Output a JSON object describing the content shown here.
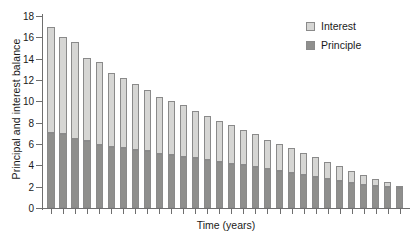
{
  "chart_data": {
    "type": "bar",
    "title": "",
    "subtitle": "",
    "xlabel": "Time (years)",
    "ylabel": "Principal and interest balance",
    "ylim": [
      0,
      18
    ],
    "ytick_values": [
      0,
      2,
      4,
      6,
      8,
      10,
      12,
      14,
      16,
      18
    ],
    "ytick_labels": [
      "0",
      "2",
      "4",
      "6",
      "8",
      "10",
      "12",
      "14",
      "16",
      "18"
    ],
    "xtick_labels": [],
    "grid": false,
    "stacked": true,
    "legend_position": "top-right",
    "categories": [
      1,
      2,
      3,
      4,
      5,
      6,
      7,
      8,
      9,
      10,
      11,
      12,
      13,
      14,
      15,
      16,
      17,
      18,
      19,
      20,
      21,
      22,
      23,
      24,
      25,
      26,
      27,
      28,
      29,
      30
    ],
    "series": [
      {
        "name": "Principle",
        "color": "#8f8f8d",
        "values": [
          7.0,
          6.95,
          6.45,
          6.3,
          5.95,
          5.7,
          5.6,
          5.45,
          5.3,
          5.1,
          4.95,
          4.8,
          4.65,
          4.5,
          4.35,
          4.15,
          4.0,
          3.85,
          3.65,
          3.5,
          3.3,
          3.1,
          2.9,
          2.7,
          2.5,
          2.35,
          2.2,
          2.05,
          1.95,
          1.9
        ]
      },
      {
        "name": "Interest",
        "color": "#d6d6d4",
        "values": [
          10.0,
          9.05,
          9.1,
          7.8,
          7.75,
          6.95,
          6.6,
          6.2,
          5.75,
          5.35,
          5.05,
          4.85,
          4.45,
          4.1,
          3.85,
          3.6,
          3.3,
          3.05,
          2.75,
          2.5,
          2.3,
          2.05,
          1.85,
          1.6,
          1.4,
          1.15,
          0.9,
          0.65,
          0.45,
          0.1
        ]
      }
    ],
    "totals": [
      17.0,
      16.0,
      15.55,
      14.1,
      13.7,
      12.65,
      12.2,
      11.65,
      11.05,
      10.45,
      10.0,
      9.65,
      9.1,
      8.6,
      8.2,
      7.75,
      7.3,
      6.9,
      6.4,
      6.0,
      5.6,
      5.15,
      4.75,
      4.3,
      3.9,
      3.5,
      3.1,
      2.7,
      2.4,
      2.0
    ]
  },
  "legend": {
    "items": [
      {
        "label": "Interest",
        "color": "#d6d6d4"
      },
      {
        "label": "Principle",
        "color": "#8f8f8d"
      }
    ]
  },
  "axes": {
    "x_title": "Time (years)",
    "y_title": "Principal and interest balance"
  },
  "colors": {
    "interest": "#d6d6d4",
    "principal": "#8f8f8d",
    "axis": "#6e6e6e",
    "text": "#1a1a1a",
    "background": "#ffffff"
  }
}
